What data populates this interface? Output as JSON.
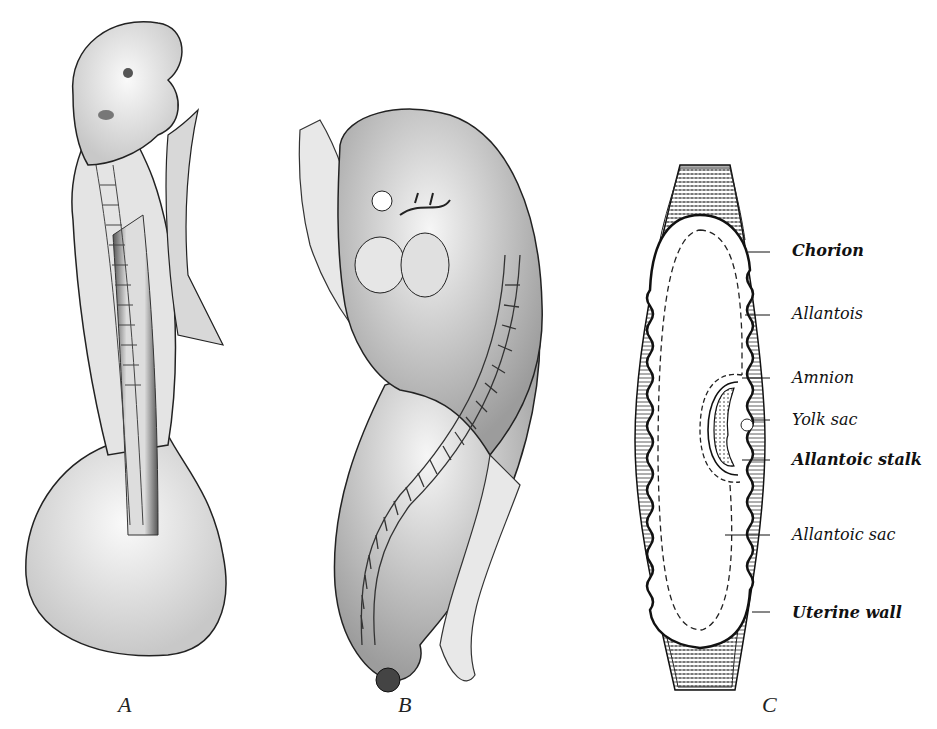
{
  "figure": {
    "panels": [
      {
        "id": "A",
        "letter": "A",
        "description": "embryo-dorsal-view-with-yolk-sac"
      },
      {
        "id": "B",
        "letter": "B",
        "description": "embryo-lateral-view"
      },
      {
        "id": "C",
        "letter": "C",
        "description": "section-of-embryo-within-uterus"
      }
    ],
    "labels_C": [
      {
        "text": "Chorion",
        "bold": true
      },
      {
        "text": "Allantois",
        "bold": false
      },
      {
        "text": "Amnion",
        "bold": false
      },
      {
        "text": "Yolk sac",
        "bold": false
      },
      {
        "text": "Allantoic stalk",
        "bold": true
      },
      {
        "text": "Allantoic sac",
        "bold": false
      },
      {
        "text": "Uterine wall",
        "bold": true
      }
    ]
  },
  "colors": {
    "ink": "#111111",
    "shade": "#9a9a9a",
    "paper": "#ffffff"
  }
}
